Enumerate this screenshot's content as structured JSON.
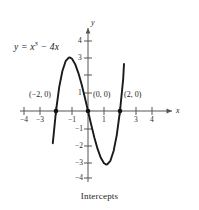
{
  "caption": "Intercepts",
  "equation": {
    "lhs": "y = x",
    "exponent": "3",
    "rhs": " − 4x",
    "full": "y = x³ − 4x"
  },
  "axes": {
    "x_name": "x",
    "y_name": "y",
    "x_ticks_negative": [
      "−4",
      "−3"
    ],
    "x_tick_neg1": "−1",
    "x_ticks_positive": [
      "1",
      "3",
      "4"
    ],
    "y_ticks_positive": [
      "4",
      "3",
      "1"
    ],
    "y_ticks_negative": [
      "−1",
      "−2",
      "−3",
      "−4"
    ]
  },
  "point_labels": [
    {
      "text": "(−2, 0)"
    },
    {
      "text": "(0, 0)"
    },
    {
      "text": "(2, 0)"
    }
  ],
  "colors": {
    "curve": "#1a1a1a",
    "axis": "#555555",
    "text": "#1b1b1b",
    "background": "#ffffff"
  },
  "chart_data": {
    "type": "line",
    "title": "Intercepts",
    "function": "y = x^3 - 4x",
    "xlabel": "x",
    "ylabel": "y",
    "xlim": [
      -4.6,
      5.0
    ],
    "ylim": [
      -4.8,
      4.6
    ],
    "grid": false,
    "legend": "none",
    "x_tick_values": [
      -4,
      -3,
      -2,
      -1,
      1,
      2,
      3,
      4
    ],
    "x_tick_labels_shown": [
      "−4",
      "−3",
      "−1",
      "1",
      "3",
      "4"
    ],
    "y_tick_values": [
      4,
      3,
      2,
      1,
      -1,
      -2,
      -3,
      -4
    ],
    "y_tick_labels_shown": [
      "4",
      "3",
      "1",
      "−1",
      "−2",
      "−3",
      "−4"
    ],
    "x_domain_drawn": [
      -2.2,
      2.25
    ],
    "series": [
      {
        "name": "y = x^3 - 4x",
        "x": [
          -2.2,
          -2.0,
          -1.8,
          -1.6,
          -1.4,
          -1.2,
          -1.15,
          -1.0,
          -0.8,
          -0.6,
          -0.4,
          -0.2,
          0.0,
          0.2,
          0.4,
          0.6,
          0.8,
          1.0,
          1.15,
          1.2,
          1.4,
          1.6,
          1.8,
          2.0,
          2.2,
          2.25
        ],
        "y": [
          -1.85,
          0.0,
          1.37,
          2.3,
          2.86,
          3.07,
          3.08,
          3.0,
          2.69,
          2.18,
          1.54,
          0.79,
          0.0,
          -0.79,
          -1.54,
          -2.18,
          -2.69,
          -3.0,
          -3.08,
          -3.07,
          -2.86,
          -2.3,
          -1.37,
          0.0,
          1.85,
          2.7
        ]
      }
    ],
    "annotated_points": [
      {
        "label": "(−2, 0)",
        "x": -2,
        "y": 0
      },
      {
        "label": "(0, 0)",
        "x": 0,
        "y": 0
      },
      {
        "label": "(2, 0)",
        "x": 2,
        "y": 0
      }
    ]
  }
}
